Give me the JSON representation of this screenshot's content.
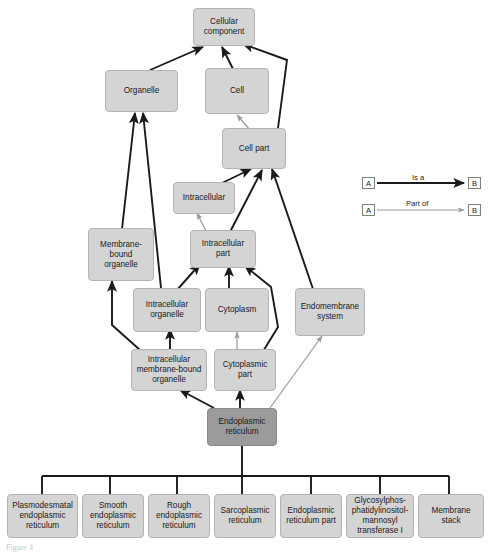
{
  "figure": {
    "caption": "Figure 4",
    "colors": {
      "node_fill": "#d4d4d4",
      "node_border": "#b4b4b4",
      "highlight_fill": "#9b9b9b",
      "is_a_arrow": "#1a1a1a",
      "part_of_arrow": "#9a9a9a",
      "background": "#ffffff"
    }
  },
  "nodes": {
    "cellular_component": "Cellular component",
    "organelle": "Organelle",
    "cell": "Cell",
    "cell_part": "Cell part",
    "intracellular": "Intracellular",
    "membrane_bound_organelle": "Membrane-bound organelle",
    "intracellular_part": "Intracellular part",
    "intracellular_organelle": "Intracellular organelle",
    "cytoplasm": "Cytoplasm",
    "endomembrane_system": "Endomembrane system",
    "intracellular_membrane_bound_organelle": "Intracellular membrane-bound organelle",
    "cytoplasmic_part": "Cytoplasmic part",
    "endoplasmic_reticulum": "Endoplasmic reticulum"
  },
  "children": [
    "Plasmodesmatal endoplasmic reticulum",
    "Smooth endoplasmic reticulum",
    "Rough endoplasmic reticulum",
    "Sarcoplasmic reticulum",
    "Endoplasmic reticulum part",
    "Glycosylphos-phatidylinositol-mannosyl transferase I",
    "Membrane stack"
  ],
  "legend": {
    "is_a": {
      "from": "A",
      "label": "Is a",
      "to": "B"
    },
    "part_of": {
      "from": "A",
      "label": "Part of",
      "to": "B"
    }
  },
  "edges": [
    {
      "from": "organelle",
      "to": "cellular_component",
      "type": "is a"
    },
    {
      "from": "cell",
      "to": "cellular_component",
      "type": "is a"
    },
    {
      "from": "cell_part",
      "to": "cellular_component",
      "type": "is a"
    },
    {
      "from": "cell_part",
      "to": "cell",
      "type": "part of"
    },
    {
      "from": "intracellular",
      "to": "cell_part",
      "type": "is a"
    },
    {
      "from": "intracellular_part",
      "to": "cell_part",
      "type": "is a"
    },
    {
      "from": "intracellular_part",
      "to": "intracellular",
      "type": "part of"
    },
    {
      "from": "endomembrane_system",
      "to": "cell_part",
      "type": "is a"
    },
    {
      "from": "membrane_bound_organelle",
      "to": "organelle",
      "type": "is a"
    },
    {
      "from": "intracellular_organelle",
      "to": "organelle",
      "type": "is a"
    },
    {
      "from": "intracellular_organelle",
      "to": "intracellular_part",
      "type": "is a"
    },
    {
      "from": "cytoplasm",
      "to": "intracellular_part",
      "type": "is a"
    },
    {
      "from": "cytoplasmic_part",
      "to": "intracellular_part",
      "type": "is a"
    },
    {
      "from": "cytoplasmic_part",
      "to": "cytoplasm",
      "type": "part of"
    },
    {
      "from": "intracellular_membrane_bound_organelle",
      "to": "membrane_bound_organelle",
      "type": "is a"
    },
    {
      "from": "intracellular_membrane_bound_organelle",
      "to": "intracellular_organelle",
      "type": "is a"
    },
    {
      "from": "endoplasmic_reticulum",
      "to": "intracellular_membrane_bound_organelle",
      "type": "is a"
    },
    {
      "from": "endoplasmic_reticulum",
      "to": "cytoplasmic_part",
      "type": "is a"
    },
    {
      "from": "endoplasmic_reticulum",
      "to": "endomembrane_system",
      "type": "part of"
    }
  ]
}
